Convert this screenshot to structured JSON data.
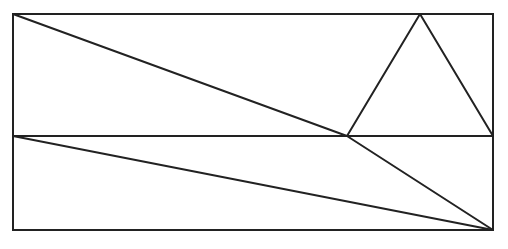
{
  "diagram": {
    "width": 508,
    "height": 249,
    "stroke_color": "#222222",
    "stroke_width": 2,
    "background": "#ffffff",
    "rectangle": {
      "x1": 13,
      "y1": 14,
      "x2": 493,
      "y2": 230
    },
    "points": {
      "A": [
        13,
        14
      ],
      "B": [
        493,
        14
      ],
      "C": [
        493,
        230
      ],
      "D": [
        13,
        230
      ],
      "E": [
        13,
        136
      ],
      "F": [
        493,
        136
      ],
      "P": [
        347,
        136
      ],
      "T": [
        420,
        14
      ]
    },
    "segments": [
      {
        "name": "midline",
        "from": "E",
        "to": "F"
      },
      {
        "name": "diagonal-a-to-p",
        "from": "A",
        "to": "P"
      },
      {
        "name": "segment-p-to-c",
        "from": "P",
        "to": "C"
      },
      {
        "name": "segment-e-to-c",
        "from": "E",
        "to": "C"
      },
      {
        "name": "triangle-left-side",
        "from": "P",
        "to": "T"
      },
      {
        "name": "triangle-right-side",
        "from": "T",
        "to": "F"
      }
    ]
  }
}
